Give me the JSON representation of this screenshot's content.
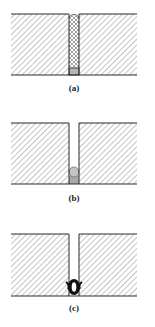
{
  "figure": {
    "panels": [
      {
        "id": "a",
        "label": "(a)",
        "description": "joint gap filled with crosshatched sealant over grey backer"
      },
      {
        "id": "b",
        "label": "(b)",
        "description": "empty joint gap with circular backer rod at bottom"
      },
      {
        "id": "c",
        "label": "(c)",
        "description": "joint gap with dark hollow bulb seal at bottom"
      }
    ],
    "colors": {
      "outline": "#2a2a2a",
      "hatch": "#8a8a8a",
      "backer": "#b5b5b5",
      "seal": "#111111"
    }
  }
}
